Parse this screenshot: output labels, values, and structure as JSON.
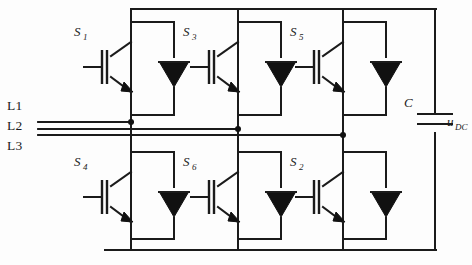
{
  "diagram": {
    "type": "circuit-schematic",
    "background_color": "#fdfdfd",
    "line_color": "#1b1b1b"
  },
  "phases": [
    {
      "id": "L1",
      "label": "L1"
    },
    {
      "id": "L2",
      "label": "L2"
    },
    {
      "id": "L3",
      "label": "L3"
    }
  ],
  "switches": {
    "upper": [
      {
        "id": "S1",
        "base": "S",
        "sub": "1"
      },
      {
        "id": "S3",
        "base": "S",
        "sub": "3"
      },
      {
        "id": "S5",
        "base": "S",
        "sub": "5"
      }
    ],
    "lower": [
      {
        "id": "S4",
        "base": "S",
        "sub": "4"
      },
      {
        "id": "S6",
        "base": "S",
        "sub": "6"
      },
      {
        "id": "S2",
        "base": "S",
        "sub": "2"
      }
    ]
  },
  "capacitor": {
    "label": "C",
    "voltage_base": "u",
    "voltage_sub": "DC"
  },
  "components": {
    "igbt_count": 6,
    "diode_count": 6,
    "capacitor_count": 1
  }
}
